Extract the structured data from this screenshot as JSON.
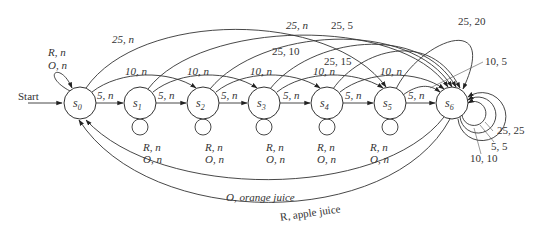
{
  "diagram": {
    "type": "finite-state-machine",
    "start_label": "Start",
    "states": [
      {
        "id": "s0",
        "label": "s",
        "sub": "0"
      },
      {
        "id": "s1",
        "label": "s",
        "sub": "1"
      },
      {
        "id": "s2",
        "label": "s",
        "sub": "2"
      },
      {
        "id": "s3",
        "label": "s",
        "sub": "3"
      },
      {
        "id": "s4",
        "label": "s",
        "sub": "4"
      },
      {
        "id": "s5",
        "label": "s",
        "sub": "5"
      },
      {
        "id": "s6",
        "label": "s",
        "sub": "6"
      }
    ],
    "self_loop_labels": {
      "s0": [
        "R, n",
        "O, n"
      ],
      "s1": [
        "R, n",
        "O, n"
      ],
      "s2": [
        "R, n",
        "O, n"
      ],
      "s3": [
        "R, n",
        "O, n"
      ],
      "s4": [
        "R, n",
        "O, n"
      ],
      "s5": [
        "R, n",
        "O, n"
      ],
      "s6": [
        "25, 25",
        "5, 5",
        "10, 10"
      ]
    },
    "edges": [
      {
        "from": "s0",
        "to": "s1",
        "label": "5, n"
      },
      {
        "from": "s1",
        "to": "s2",
        "label": "5, n"
      },
      {
        "from": "s2",
        "to": "s3",
        "label": "5, n"
      },
      {
        "from": "s3",
        "to": "s4",
        "label": "5, n"
      },
      {
        "from": "s4",
        "to": "s5",
        "label": "5, n"
      },
      {
        "from": "s5",
        "to": "s6",
        "label": "5, n"
      },
      {
        "from": "s0",
        "to": "s2",
        "label": "10, n"
      },
      {
        "from": "s1",
        "to": "s3",
        "label": "10, n"
      },
      {
        "from": "s2",
        "to": "s4",
        "label": "10, n"
      },
      {
        "from": "s3",
        "to": "s5",
        "label": "10, n"
      },
      {
        "from": "s4",
        "to": "s6",
        "label": "10, n"
      },
      {
        "from": "s5",
        "to": "s6",
        "label": "10, 5"
      },
      {
        "from": "s0",
        "to": "s5",
        "label": "25, n"
      },
      {
        "from": "s1",
        "to": "s6",
        "label": "25, n"
      },
      {
        "from": "s2",
        "to": "s6",
        "label": "25, 5"
      },
      {
        "from": "s3",
        "to": "s6",
        "label": "25, 10"
      },
      {
        "from": "s4",
        "to": "s6",
        "label": "25, 15"
      },
      {
        "from": "s5",
        "to": "s6",
        "label": "25, 20"
      },
      {
        "from": "s6",
        "to": "s0",
        "label": "O, orange juice"
      },
      {
        "from": "s6",
        "to": "s0",
        "label": "R, apple juice"
      }
    ]
  }
}
